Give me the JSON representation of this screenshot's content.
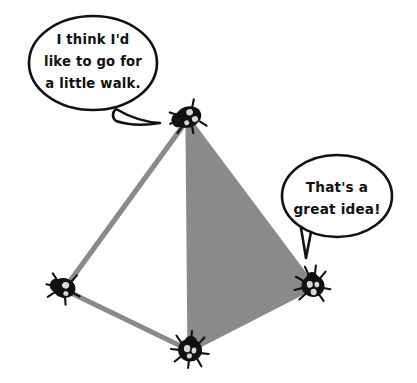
{
  "illustration": {
    "title": "Bugs on a tetrahedron",
    "background_color": "#ffffff",
    "ink_color": "#111111",
    "face_color": "#8a8a8a",
    "edge_color": "#8a8a8a",
    "bug_spot_color": "#d8d8d8"
  },
  "speech_bubbles": [
    {
      "id": "top-left-bubble",
      "speaker": "top-bug",
      "lines": [
        "I think I'd",
        "like to go for",
        "a little walk."
      ],
      "full_text": "I think I'd like to go for a little walk.",
      "tail_direction": "right-down"
    },
    {
      "id": "right-bubble",
      "speaker": "right-bug",
      "lines": [
        "That's a",
        "great idea!"
      ],
      "full_text": "That's a great idea!",
      "tail_direction": "down"
    }
  ],
  "vertices": [
    {
      "id": "top-bug",
      "label": "top",
      "x": 188,
      "y": 117
    },
    {
      "id": "left-bug",
      "label": "left",
      "x": 64,
      "y": 288
    },
    {
      "id": "bottom-bug",
      "label": "bottom-front",
      "x": 190,
      "y": 350
    },
    {
      "id": "right-bug",
      "label": "right",
      "x": 313,
      "y": 286
    }
  ],
  "edges": [
    {
      "id": "edge-top-left",
      "from": "top-bug",
      "to": "left-bug"
    },
    {
      "id": "edge-left-bottom",
      "from": "left-bug",
      "to": "bottom-bug"
    },
    {
      "id": "edge-top-bottom",
      "from": "top-bug",
      "to": "bottom-bug"
    },
    {
      "id": "edge-top-right",
      "from": "top-bug",
      "to": "right-bug"
    },
    {
      "id": "edge-bottom-right",
      "from": "bottom-bug",
      "to": "right-bug"
    }
  ],
  "faces": [
    {
      "id": "shaded-face",
      "shaded": true,
      "vertex_ids": [
        "top-bug",
        "bottom-bug",
        "right-bug"
      ],
      "color": "#8a8a8a"
    }
  ],
  "bugs": [
    {
      "id": "top-bug",
      "name": "ladybug-top",
      "spots": 3
    },
    {
      "id": "left-bug",
      "name": "ladybug-left",
      "spots": 2
    },
    {
      "id": "bottom-bug",
      "name": "ladybug-bottom",
      "spots": 3
    },
    {
      "id": "right-bug",
      "name": "ladybug-right",
      "spots": 3
    }
  ]
}
